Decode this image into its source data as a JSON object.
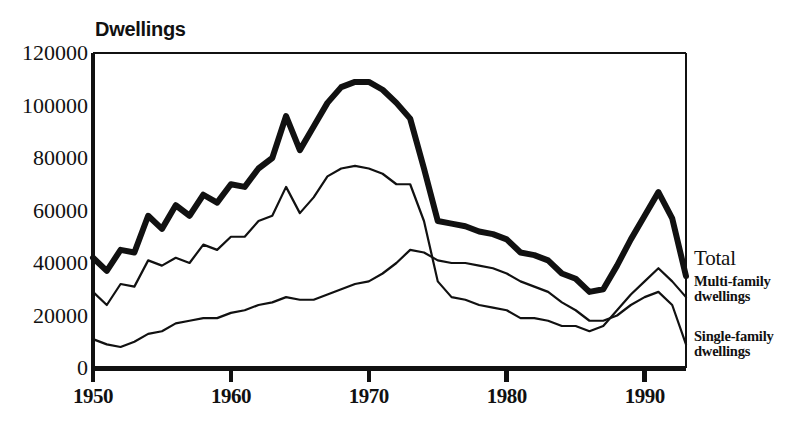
{
  "chart_data": {
    "type": "line",
    "title": "Dwellings",
    "xlabel": "",
    "ylabel": "Dwellings",
    "xlim": [
      1950,
      1993
    ],
    "ylim": [
      0,
      120000
    ],
    "ytick_labels": [
      "0",
      "20000",
      "40000",
      "60000",
      "80000",
      "100000",
      "120000"
    ],
    "ytick_values": [
      0,
      20000,
      40000,
      60000,
      80000,
      100000,
      120000
    ],
    "xtick_labels": [
      "1950",
      "1960",
      "1970",
      "1980",
      "1990"
    ],
    "xtick_values": [
      1950,
      1960,
      1970,
      1980,
      1990
    ],
    "grid": false,
    "legend_position": "right",
    "x": [
      1950,
      1951,
      1952,
      1953,
      1954,
      1955,
      1956,
      1957,
      1958,
      1959,
      1960,
      1961,
      1962,
      1963,
      1964,
      1965,
      1966,
      1967,
      1968,
      1969,
      1970,
      1971,
      1972,
      1973,
      1974,
      1975,
      1976,
      1977,
      1978,
      1979,
      1980,
      1981,
      1982,
      1983,
      1984,
      1985,
      1986,
      1987,
      1988,
      1989,
      1990,
      1991,
      1992,
      1993
    ],
    "series": [
      {
        "name": "Total",
        "label": "Total",
        "linewidth": 6,
        "color": "#111111",
        "values": [
          42000,
          37000,
          45000,
          44000,
          58000,
          53000,
          62000,
          58000,
          66000,
          63000,
          70000,
          69000,
          76000,
          80000,
          96000,
          83000,
          92000,
          101000,
          107000,
          109000,
          109000,
          106000,
          101000,
          95000,
          76000,
          56000,
          55000,
          54000,
          52000,
          51000,
          49000,
          44000,
          43000,
          41000,
          36000,
          34000,
          29000,
          30000,
          39000,
          49000,
          58000,
          67000,
          57000,
          35000
        ]
      },
      {
        "name": "Multi-family dwellings",
        "label_line1": "Multi-family",
        "label_line2": "dwellings",
        "linewidth": 2.2,
        "color": "#111111",
        "values": [
          29000,
          24000,
          32000,
          31000,
          41000,
          39000,
          42000,
          40000,
          47000,
          45000,
          50000,
          50000,
          56000,
          58000,
          69000,
          59000,
          65000,
          73000,
          76000,
          77000,
          76000,
          74000,
          70000,
          70000,
          56000,
          33000,
          27000,
          26000,
          24000,
          23000,
          22000,
          19000,
          19000,
          18000,
          16000,
          16000,
          14000,
          16000,
          22000,
          28000,
          33000,
          38000,
          33000,
          27000
        ]
      },
      {
        "name": "Single-family dwellings",
        "label_line1": "Single-family",
        "label_line2": "dwellings",
        "linewidth": 2.2,
        "color": "#111111",
        "values": [
          11000,
          9000,
          8000,
          10000,
          13000,
          14000,
          17000,
          18000,
          19000,
          19000,
          21000,
          22000,
          24000,
          25000,
          27000,
          26000,
          26000,
          28000,
          30000,
          32000,
          33000,
          36000,
          40000,
          45000,
          44000,
          41000,
          40000,
          40000,
          39000,
          38000,
          36000,
          33000,
          31000,
          29000,
          25000,
          22000,
          18000,
          18000,
          20000,
          24000,
          27000,
          29000,
          24000,
          9000
        ]
      }
    ]
  },
  "axes": {
    "title": "Dwellings"
  },
  "legend": {
    "total": "Total",
    "multi_line1": "Multi-family",
    "multi_line2": "dwellings",
    "single_line1": "Single-family",
    "single_line2": "dwellings"
  }
}
